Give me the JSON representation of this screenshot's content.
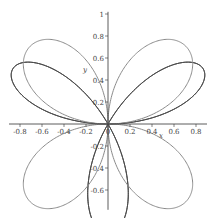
{
  "chart_data": {
    "type": "line",
    "subtype": "polar-curves",
    "title": "",
    "xlabel": "x",
    "ylabel": "y",
    "xlim": [
      -0.9,
      0.9
    ],
    "ylim": [
      -0.78,
      1.02
    ],
    "grid": false,
    "legend": null,
    "x_ticks": [
      "-0.8",
      "-0.6",
      "-0.4",
      "-0.2",
      "0",
      "0.2",
      "0.4",
      "0.6",
      "0.8"
    ],
    "x_tick_values": [
      -0.8,
      -0.6,
      -0.4,
      -0.2,
      0,
      0.2,
      0.4,
      0.6,
      0.8
    ],
    "y_ticks": [
      "-0.6",
      "-0.4",
      "-0.2",
      "0.2",
      "0.4",
      "0.6",
      "0.8",
      "1"
    ],
    "y_tick_values": [
      -0.6,
      -0.4,
      -0.2,
      0.2,
      0.4,
      0.6,
      0.8,
      1.0
    ],
    "series": [
      {
        "name": "r = sin(3θ)",
        "color": "#4a4a4a",
        "k": 3,
        "petals": 3,
        "petal_angles_deg": [
          90,
          210,
          330
        ],
        "max_r": 1.0
      },
      {
        "name": "r = sin(2θ)",
        "color": "#8a8a8a",
        "k": 2,
        "petals": 4,
        "petal_angles_deg": [
          45,
          135,
          225,
          315
        ],
        "max_r": 1.0
      }
    ]
  },
  "layout": {
    "origin_px": [
      108,
      124
    ],
    "scale_px_per_unit": 110
  }
}
